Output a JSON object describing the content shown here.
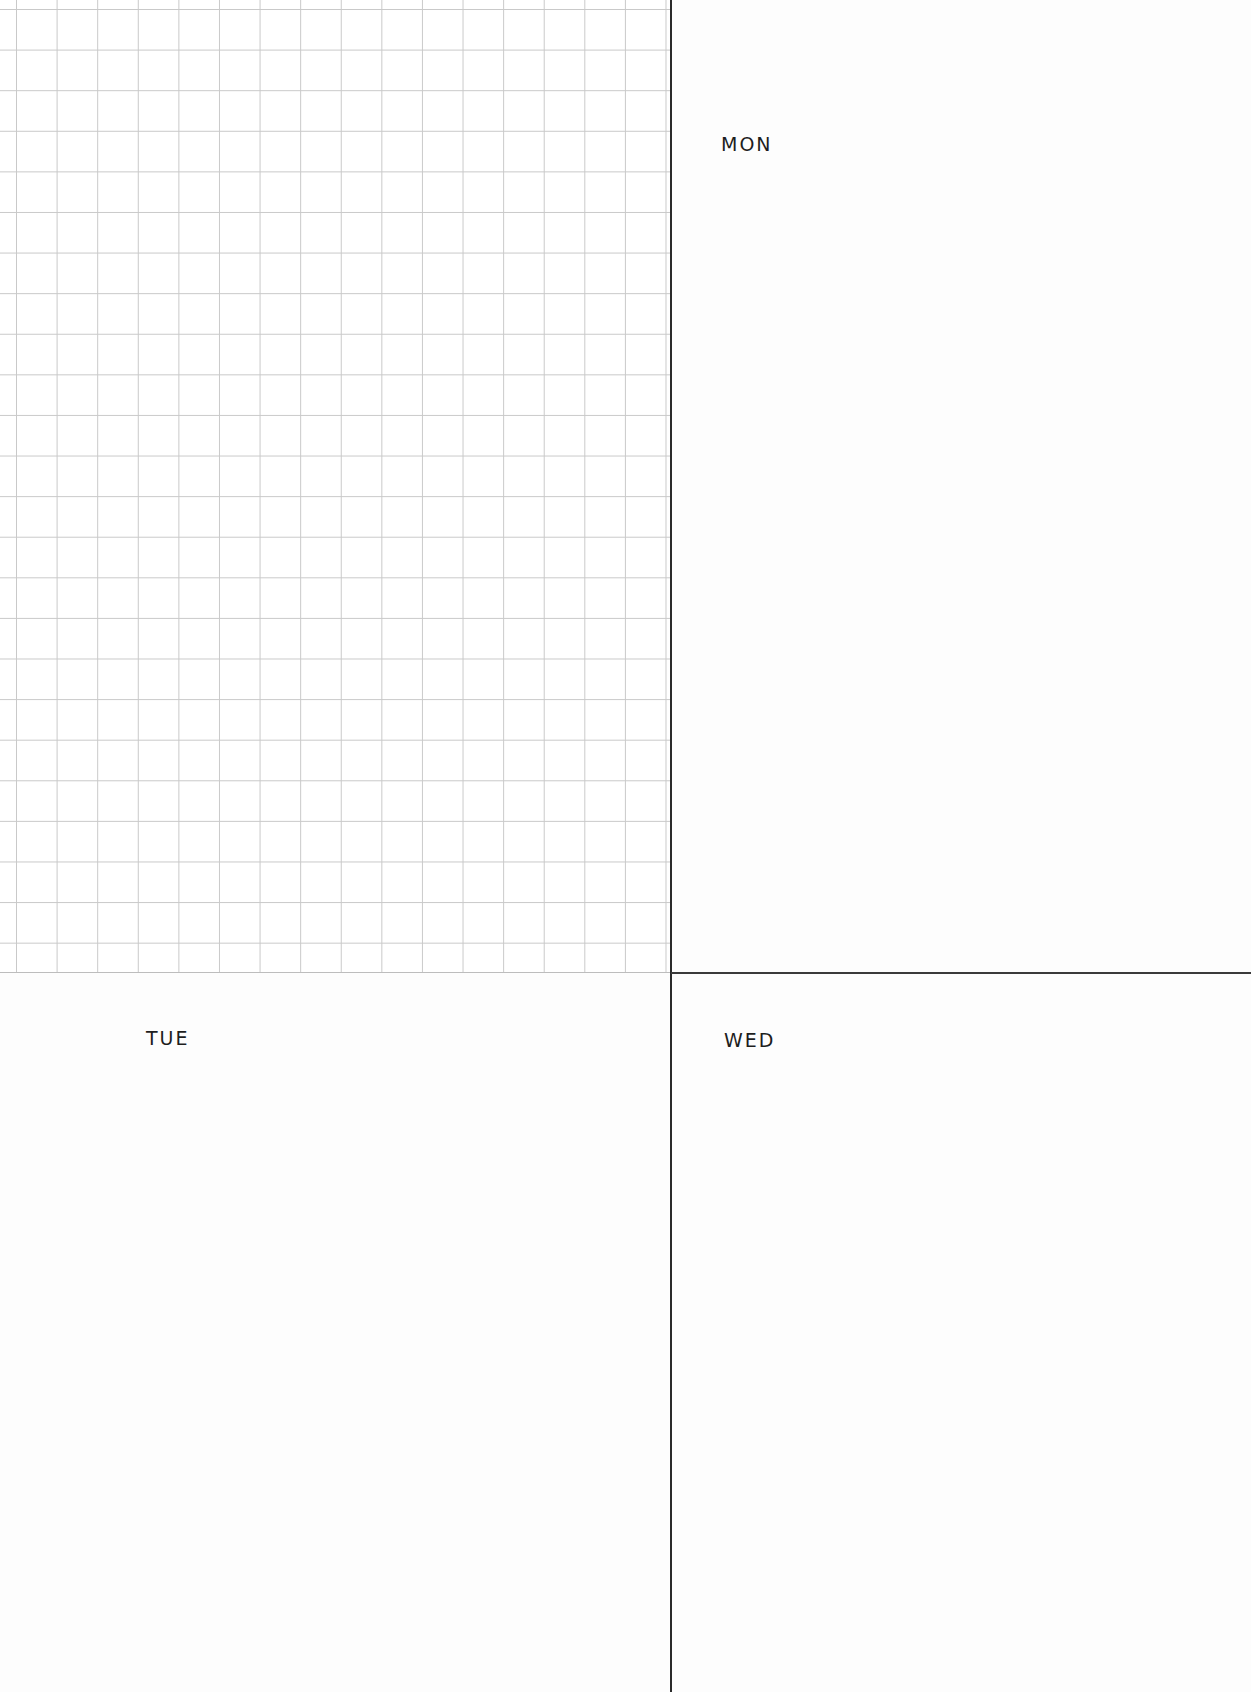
{
  "planner": {
    "grid_panel": {
      "type": "grid-notes",
      "line_color": "#c9c9c9",
      "cell_size_px": 40.6
    },
    "divider_color": "#2a2a2a",
    "days": [
      {
        "id": "mon",
        "label": "MON"
      },
      {
        "id": "tue",
        "label": "TUE"
      },
      {
        "id": "wed",
        "label": "WED"
      }
    ]
  }
}
